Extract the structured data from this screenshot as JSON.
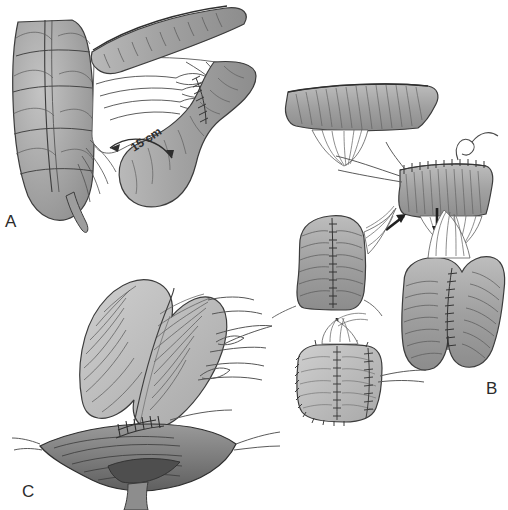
{
  "figure": {
    "type": "surgical-illustration",
    "background_color": "#ffffff",
    "line_color": "#3a3a3a",
    "panels": [
      {
        "id": "A",
        "label": "A",
        "label_position": {
          "x": 5,
          "y": 212
        },
        "caption_text": "",
        "annotations": [
          {
            "name": "length-measurement",
            "text": "15 cm",
            "x": 135,
            "y": 150,
            "rotation": -32,
            "arrow": "double-headed-curved"
          }
        ],
        "structures": [
          "haustrated-colon",
          "appendix",
          "mesentery",
          "vascular-arcade",
          "transverse-colon-segment",
          "divided-bowel-stump",
          "staple-line"
        ]
      },
      {
        "id": "B",
        "label": "B",
        "label_position": {
          "x": 486,
          "y": 379
        },
        "caption_text": "",
        "annotations": [
          {
            "name": "arrow-to-opened-segment",
            "direction": "up-right",
            "x": 396,
            "y": 222
          },
          {
            "name": "arrow-to-folded-pouch",
            "direction": "down",
            "x": 437,
            "y": 222
          },
          {
            "name": "arrow-to-closed-pouch",
            "direction": "down",
            "x": 337,
            "y": 330
          }
        ],
        "structures": [
          "bowel-segment-horizontal",
          "bowel-segment-with-suture-thread",
          "opened-bowel-longitudinal-incision",
          "folded-j-pouch",
          "completed-pouch",
          "mesentery-fan",
          "running-suture-line"
        ]
      },
      {
        "id": "C",
        "label": "C",
        "label_position": {
          "x": 22,
          "y": 482
        },
        "caption_text": "",
        "annotations": [],
        "structures": [
          "colonic-pouch",
          "anal-canal",
          "coloanal-anastomosis",
          "interrupted-sutures",
          "retractor-threads",
          "mesentery"
        ]
      }
    ],
    "palette": {
      "bowel_fill_light": "#c9c9c9",
      "bowel_fill_mid": "#a3a3a3",
      "bowel_fill_dark": "#8a8a8a",
      "bowel_fill_darker": "#6f6f6f",
      "outline": "#3c3c3c",
      "mesentery_fill": "#ffffff",
      "suture": "#4a4a4a",
      "label": "#2b2b2b"
    }
  }
}
